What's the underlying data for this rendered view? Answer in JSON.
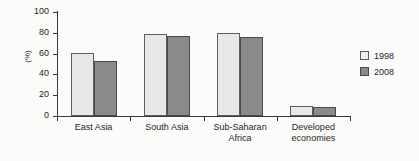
{
  "chart_data": {
    "type": "bar",
    "title": "",
    "subtitle": "",
    "xlabel": "",
    "ylabel": "(%)",
    "ylim": [
      0,
      100
    ],
    "yticks": [
      0,
      20,
      40,
      60,
      80,
      100
    ],
    "ytick_labels": [
      "0",
      "20",
      "40",
      "60",
      "80",
      "100"
    ],
    "grid": false,
    "legend_position": "right",
    "categories": [
      "East Asia",
      "South Asia",
      "Sub-Saharan\nAfrica",
      "Developed\neconomies"
    ],
    "series": [
      {
        "name": "1998",
        "color": "#e8e8e8",
        "values": [
          61,
          79,
          80,
          10
        ]
      },
      {
        "name": "2008",
        "color": "#8a8a8a",
        "values": [
          53,
          77,
          76,
          9
        ]
      }
    ],
    "annotations": []
  },
  "colors": {
    "series_1998": "#e8e8e8",
    "series_2008": "#8a8a8a",
    "axis": "#3a3a3a",
    "text": "#262626",
    "background": "#fbfbfa",
    "bar_outline": "#5d5d5d"
  }
}
